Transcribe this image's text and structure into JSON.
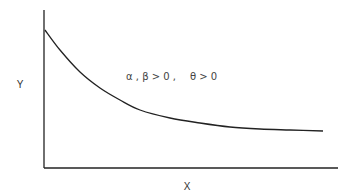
{
  "chart_data": {
    "type": "line",
    "title": "",
    "xlabel": "X",
    "ylabel": "Y",
    "grid": false,
    "legend": null,
    "annotations": [
      "α , β > 0 ,",
      "θ > 0"
    ],
    "series": [
      {
        "name": "curve",
        "points_px": [
          [
            45,
            30
          ],
          [
            60,
            50
          ],
          [
            80,
            72
          ],
          [
            100,
            88
          ],
          [
            120,
            100
          ],
          [
            140,
            110
          ],
          [
            170,
            118
          ],
          [
            200,
            123
          ],
          [
            230,
            127
          ],
          [
            260,
            129
          ],
          [
            290,
            130
          ],
          [
            323,
            131
          ]
        ]
      }
    ],
    "axes": {
      "origin_px": [
        44,
        168
      ],
      "y_top_px": 10,
      "x_end_px": 338,
      "ticks": []
    }
  },
  "labels": {
    "x": "X",
    "y": "Y",
    "annotation_1": "α , β > 0 ,",
    "annotation_2": "θ > 0"
  },
  "colors": {
    "line": "#222222",
    "axis": "#222222",
    "text": "#333333"
  }
}
